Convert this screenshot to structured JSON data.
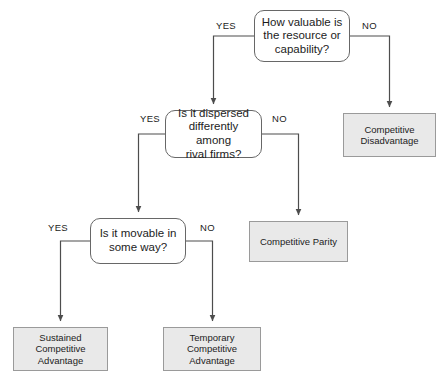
{
  "diagram": {
    "type": "flowchart",
    "colors": {
      "decision_border": "#676767",
      "decision_fill": "#ffffff",
      "terminal_border": "#9a9a9a",
      "terminal_fill": "#e9e9e9",
      "connector": "#4d4d4d",
      "text": "#1c1c1c",
      "background": "#ffffff"
    },
    "nodes": [
      {
        "id": "q-valuable",
        "kind": "decision",
        "text": "How valuable is\nthe resource or\ncapability?",
        "x": 254,
        "y": 10,
        "w": 96,
        "h": 52
      },
      {
        "id": "q-dispersed",
        "kind": "decision",
        "text": "Is it dispersed\ndifferently among\nrival firms?",
        "x": 165,
        "y": 110,
        "w": 97,
        "h": 48
      },
      {
        "id": "q-movable",
        "kind": "decision",
        "text": "Is it movable in\nsome way?",
        "x": 90,
        "y": 218,
        "w": 96,
        "h": 46
      },
      {
        "id": "r-disadvantage",
        "kind": "terminal",
        "text": "Competitive\nDisadvantage",
        "x": 343,
        "y": 113,
        "w": 93,
        "h": 44
      },
      {
        "id": "r-parity",
        "kind": "terminal",
        "text": "Competitive Parity",
        "x": 249,
        "y": 221,
        "w": 99,
        "h": 41
      },
      {
        "id": "r-sustained",
        "kind": "terminal",
        "text": "Sustained\nCompetitive\nAdvantage",
        "x": 13,
        "y": 327,
        "w": 95,
        "h": 44
      },
      {
        "id": "r-temporary",
        "kind": "terminal",
        "text": "Temporary\nCompetitive\nAdvantage",
        "x": 163,
        "y": 327,
        "w": 98,
        "h": 44
      }
    ],
    "edges": [
      {
        "id": "e-valuable-yes",
        "from": "q-valuable",
        "to": "q-dispersed",
        "label": "YES",
        "label_x": 216,
        "label_y": 20
      },
      {
        "id": "e-valuable-no",
        "from": "q-valuable",
        "to": "r-disadvantage",
        "label": "NO",
        "label_x": 362,
        "label_y": 20
      },
      {
        "id": "e-dispersed-yes",
        "from": "q-dispersed",
        "to": "q-movable",
        "label": "YES",
        "label_x": 140,
        "label_y": 113
      },
      {
        "id": "e-dispersed-no",
        "from": "q-dispersed",
        "to": "r-parity",
        "label": "NO",
        "label_x": 272,
        "label_y": 113
      },
      {
        "id": "e-movable-yes",
        "from": "q-movable",
        "to": "r-sustained",
        "label": "YES",
        "label_x": 48,
        "label_y": 222
      },
      {
        "id": "e-movable-no",
        "from": "q-movable",
        "to": "r-temporary",
        "label": "NO",
        "label_x": 200,
        "label_y": 222
      }
    ]
  }
}
